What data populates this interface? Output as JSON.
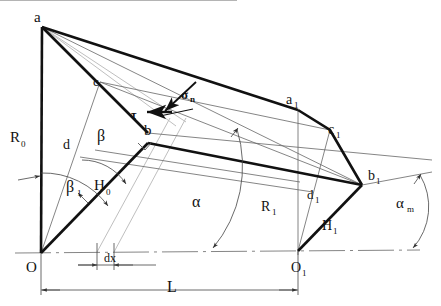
{
  "diagram": {
    "background_color": "#ffffff",
    "stroke_color": "#111111",
    "thin_color": "#555555",
    "faint_color": "#b9b9b9",
    "width": 441,
    "height": 306,
    "points": {
      "a": {
        "label": "a",
        "x": 42,
        "y": 27
      },
      "c": {
        "label": "c",
        "x": 100,
        "y": 82
      },
      "b": {
        "label": "b",
        "x": 148,
        "y": 133
      },
      "O": {
        "label": "O",
        "x": 41,
        "y": 253
      },
      "a1": {
        "label": "a",
        "sub": "1",
        "x": 298,
        "y": 110
      },
      "c1": {
        "label": "c",
        "sub": "1",
        "x": 330,
        "y": 130
      },
      "b1": {
        "label": "b",
        "sub": "1",
        "x": 362,
        "y": 185
      },
      "O1": {
        "label": "O",
        "sub": "1",
        "x": 298,
        "y": 251
      }
    },
    "labels": [
      {
        "name": "label-a",
        "text": "a",
        "sub": "",
        "x": 34,
        "y": 18,
        "size": 14
      },
      {
        "name": "label-c",
        "text": "c",
        "sub": "",
        "x": 94,
        "y": 79,
        "size": 13
      },
      {
        "name": "label-b",
        "text": "b",
        "sub": "",
        "x": 146,
        "y": 129,
        "size": 14
      },
      {
        "name": "label-O",
        "text": "O",
        "sub": "",
        "x": 29,
        "y": 270,
        "size": 14
      },
      {
        "name": "label-a1",
        "text": "a",
        "sub": "1",
        "x": 288,
        "y": 100,
        "size": 13
      },
      {
        "name": "label-c1",
        "text": "c",
        "sub": "1",
        "x": 329,
        "y": 129,
        "size": 13
      },
      {
        "name": "label-b1",
        "text": "b",
        "sub": "1",
        "x": 370,
        "y": 177,
        "size": 13
      },
      {
        "name": "label-O1",
        "text": "O",
        "sub": "1",
        "x": 294,
        "y": 268,
        "size": 13
      },
      {
        "name": "label-R0",
        "text": "R",
        "sub": "0",
        "x": 14,
        "y": 137,
        "size": 14
      },
      {
        "name": "label-R1",
        "text": "R",
        "sub": "1",
        "x": 264,
        "y": 206,
        "size": 13
      },
      {
        "name": "label-H0",
        "text": "H",
        "sub": "0",
        "x": 97,
        "y": 185,
        "size": 14
      },
      {
        "name": "label-H1",
        "text": "H",
        "sub": "1",
        "x": 325,
        "y": 225,
        "size": 13
      },
      {
        "name": "label-d",
        "text": "d",
        "sub": "",
        "x": 66,
        "y": 144,
        "size": 13
      },
      {
        "name": "label-d1",
        "text": "d",
        "sub": "1",
        "x": 310,
        "y": 194,
        "size": 12
      },
      {
        "name": "label-L",
        "text": "L",
        "sub": "",
        "x": 171,
        "y": 286,
        "size": 14
      },
      {
        "name": "label-dx",
        "text": "dx",
        "sub": "",
        "x": 110,
        "y": 264,
        "size": 11
      }
    ],
    "greek_labels": [
      {
        "name": "label-beta",
        "text": "β",
        "sub": "",
        "x": 101,
        "y": 134,
        "size": 15
      },
      {
        "name": "label-beta1",
        "text": "β",
        "sub": "1",
        "x": 71,
        "y": 185,
        "size": 15
      },
      {
        "name": "label-alpha",
        "text": "α",
        "sub": "",
        "x": 196,
        "y": 200,
        "size": 15
      },
      {
        "name": "label-alpha-m",
        "text": "α",
        "sub": "m",
        "x": 402,
        "y": 202,
        "size": 14
      },
      {
        "name": "label-sigma-n",
        "text": "σ",
        "sub": "n",
        "x": 185,
        "y": 95,
        "size": 12
      },
      {
        "name": "label-tau",
        "text": "τ",
        "sub": "",
        "x": 136,
        "y": 115,
        "size": 11
      }
    ],
    "measures": {
      "L_label": "L",
      "dx_label": "dx",
      "R0_label": "R0",
      "R1_label": "R1",
      "H0_label": "H0",
      "H1_label": "H1"
    },
    "icon_names": [
      "arrowhead-icon",
      "angle-arc-icon",
      "dimension-line-icon",
      "centerline-icon"
    ]
  }
}
